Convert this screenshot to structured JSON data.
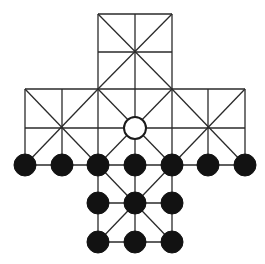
{
  "game": {
    "type": "cross-shaped-hunt-board",
    "colors": {
      "line": "#2a2a2a",
      "black_piece": "#121212",
      "white_piece": "#ffffff"
    },
    "columns_x": [
      25,
      62,
      98,
      135,
      172,
      208,
      245
    ],
    "rows_y": [
      14,
      52,
      89,
      128,
      165,
      203,
      242
    ],
    "piece_radius": 11,
    "lines": [
      [
        2,
        0,
        4,
        0
      ],
      [
        2,
        1,
        4,
        1
      ],
      [
        0,
        2,
        6,
        2
      ],
      [
        0,
        3,
        6,
        3
      ],
      [
        0,
        4,
        6,
        4
      ],
      [
        2,
        5,
        4,
        5
      ],
      [
        2,
        6,
        4,
        6
      ],
      [
        2,
        0,
        2,
        6
      ],
      [
        3,
        0,
        3,
        6
      ],
      [
        4,
        0,
        4,
        6
      ],
      [
        0,
        2,
        0,
        4
      ],
      [
        1,
        2,
        1,
        4
      ],
      [
        5,
        2,
        5,
        4
      ],
      [
        6,
        2,
        6,
        4
      ],
      [
        2,
        0,
        4,
        2
      ],
      [
        4,
        0,
        2,
        2
      ],
      [
        0,
        2,
        2,
        4
      ],
      [
        2,
        2,
        0,
        4
      ],
      [
        4,
        2,
        6,
        4
      ],
      [
        6,
        2,
        4,
        4
      ],
      [
        2,
        2,
        4,
        4
      ],
      [
        4,
        2,
        2,
        4
      ],
      [
        2,
        4,
        4,
        6
      ],
      [
        4,
        4,
        2,
        6
      ]
    ],
    "pieces": [
      {
        "color": "white",
        "col": 3,
        "row": 3,
        "label": "fox"
      },
      {
        "color": "black",
        "col": 0,
        "row": 4
      },
      {
        "color": "black",
        "col": 1,
        "row": 4
      },
      {
        "color": "black",
        "col": 2,
        "row": 4
      },
      {
        "color": "black",
        "col": 3,
        "row": 4
      },
      {
        "color": "black",
        "col": 4,
        "row": 4
      },
      {
        "color": "black",
        "col": 5,
        "row": 4
      },
      {
        "color": "black",
        "col": 6,
        "row": 4
      },
      {
        "color": "black",
        "col": 2,
        "row": 5
      },
      {
        "color": "black",
        "col": 3,
        "row": 5
      },
      {
        "color": "black",
        "col": 4,
        "row": 5
      },
      {
        "color": "black",
        "col": 2,
        "row": 6
      },
      {
        "color": "black",
        "col": 3,
        "row": 6
      },
      {
        "color": "black",
        "col": 4,
        "row": 6
      }
    ],
    "counts": {
      "white": 1,
      "black": 13
    }
  }
}
